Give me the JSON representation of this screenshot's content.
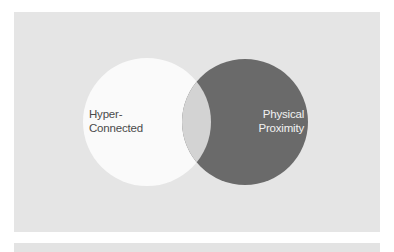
{
  "diagram": {
    "type": "venn",
    "sets": [
      {
        "id": "left",
        "label_line1": "Hyper-",
        "label_line2": "Connected",
        "fill": "#fafafa"
      },
      {
        "id": "right",
        "label_line1": "Physical",
        "label_line2": "Proximity",
        "fill": "#6a6a6a"
      }
    ],
    "overlap_fill": "#d3d3d3",
    "background": "#e5e5e5"
  }
}
